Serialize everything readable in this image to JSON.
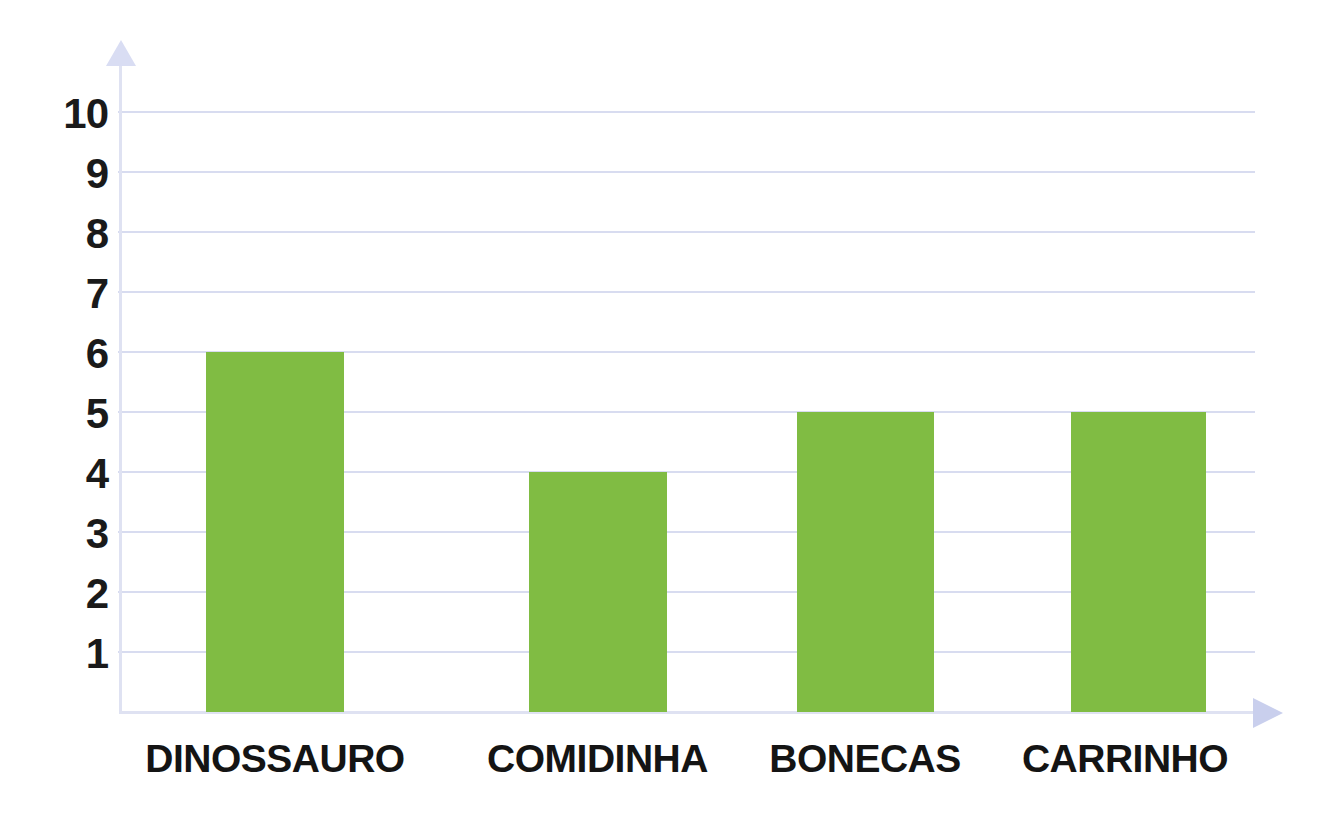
{
  "chart_data": {
    "type": "bar",
    "title": "",
    "subtitle": "",
    "xlabel": "",
    "ylabel": "",
    "categories": [
      "DINOSSAURO",
      "COMIDINHA",
      "BONECAS",
      "CARRINHO"
    ],
    "values": [
      6,
      4,
      5,
      5
    ],
    "ylim": [
      0,
      10
    ],
    "ytick_labels": [
      "10",
      "9",
      "8",
      "7",
      "6",
      "5",
      "4",
      "3",
      "2",
      "1"
    ],
    "ytick_values": [
      10,
      9,
      8,
      7,
      6,
      5,
      4,
      3,
      2,
      1
    ],
    "grid": true,
    "legend": null,
    "legend_position": "none",
    "colors": {
      "bar": "#80bc43",
      "gridline": "#d8dcf0",
      "axis": "#dfe2f2",
      "axis_arrow": "#d3d8f0",
      "label_text": "#141414",
      "tick_text": "#1a1a1a",
      "background": "#ffffff"
    }
  },
  "axes": {
    "y_arrow_name": "y-axis-arrow-up",
    "x_arrow_name": "x-axis-arrow-right"
  }
}
